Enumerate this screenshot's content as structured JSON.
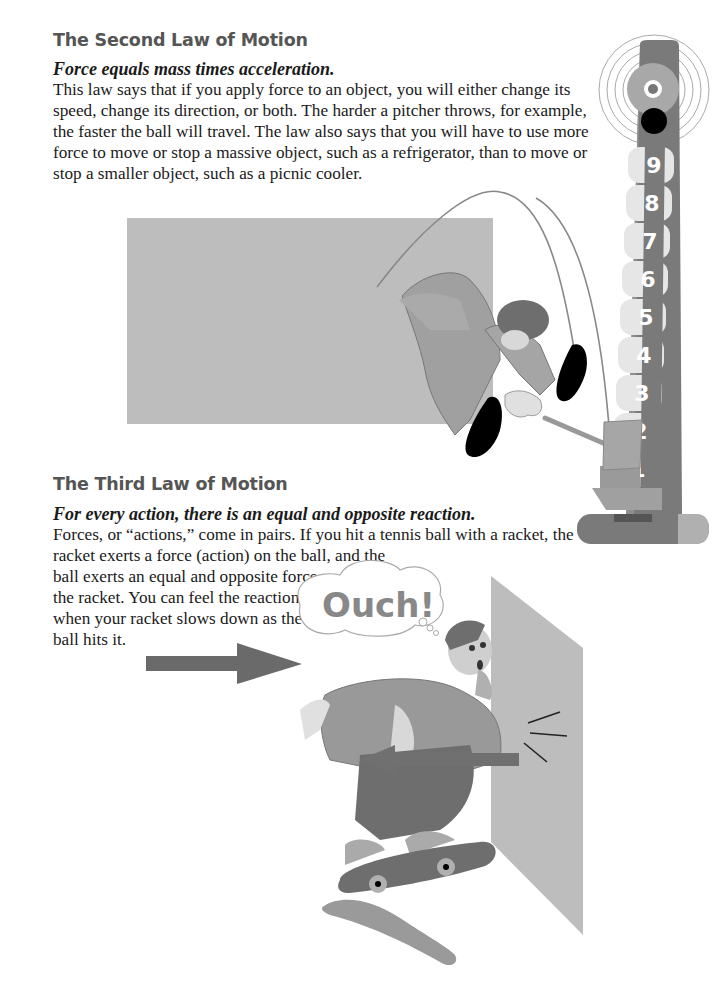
{
  "section_second_law": {
    "heading": "The Second Law of Motion",
    "lead": "Force equals mass times acceleration.",
    "lines": [
      "This law says that if you apply force to an object, you will either change its",
      "speed, change its direction, or both. The harder a pitcher throws, for example,",
      "the faster the ball will travel. The law also says that you will have to use more",
      "force to move or stop a massive object, such as a refrigerator, than to move or",
      "stop a smaller object, such as a picnic cooler."
    ]
  },
  "section_third_law": {
    "heading": "The Third Law of Motion",
    "lead": "For every action, there is an equal and opposite reaction.",
    "lines": [
      "Forces, or “actions,” come in pairs. If you hit a tennis ball with a racket, the",
      "racket exerts a force (action) on the ball, and the",
      "ball exerts an equal and opposite force on",
      "the racket. You can feel the reaction",
      "when your racket slows down as the",
      "ball hits it."
    ]
  },
  "illustration_strength_tester": {
    "scale_numbers": [
      "9",
      "8",
      "7",
      "6",
      "5",
      "4",
      "3",
      "2",
      "1"
    ],
    "icons": [
      "bell-target-icon",
      "puck-icon",
      "mallet-icon",
      "jumping-boy-icon"
    ]
  },
  "illustration_skateboarder": {
    "speech_bubble": "Ouch!",
    "icons": [
      "action-arrow-icon",
      "reaction-arrow-icon",
      "skateboarder-icon",
      "wall-icon",
      "skateboard-icon",
      "impact-lines-icon"
    ]
  },
  "colors": {
    "heading": "#555555",
    "text": "#1a1a1a",
    "panel_gray": "#b9b9b9",
    "dark_gray": "#6e6e6e",
    "mid_gray": "#999999",
    "light_gray": "#dcdcdc"
  }
}
